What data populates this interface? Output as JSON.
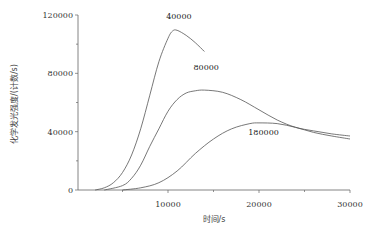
{
  "chart_data": {
    "type": "line",
    "title": "",
    "xlabel": "时间/s",
    "ylabel": "化学发光强度/(计数/s)",
    "xlim": [
      0,
      30000
    ],
    "ylim": [
      0,
      120000
    ],
    "x_ticks": [
      10000,
      20000,
      30000
    ],
    "x_tick_labels": [
      "10000",
      "20000",
      "30000"
    ],
    "y_ticks": [
      0,
      40000,
      80000,
      120000
    ],
    "y_tick_labels": [
      "0",
      "40000",
      "80000",
      "120000"
    ],
    "grid": false,
    "legend": "inline labels near curves",
    "series": [
      {
        "name": "40000",
        "label_pos": [
          11200,
          117000
        ],
        "x": [
          2000,
          3000,
          4000,
          5000,
          6000,
          7000,
          8000,
          9000,
          10000,
          10500,
          11000,
          12000,
          13000,
          14000
        ],
        "values": [
          0,
          1500,
          5000,
          12000,
          24000,
          42000,
          65000,
          88000,
          104000,
          109000,
          109500,
          106000,
          101000,
          95000
        ]
      },
      {
        "name": "80000",
        "label_pos": [
          14200,
          82000
        ],
        "x": [
          3000,
          5000,
          6000,
          7000,
          8000,
          9000,
          10000,
          11000,
          12000,
          13000,
          14000,
          16000,
          18000,
          20000,
          22000,
          24000,
          26000,
          28000,
          30000
        ],
        "values": [
          0,
          3000,
          8000,
          17000,
          30000,
          42000,
          54000,
          62000,
          66500,
          68000,
          68500,
          67000,
          62000,
          55000,
          48000,
          43000,
          40500,
          38500,
          37000
        ]
      },
      {
        "name": "180000",
        "label_pos": [
          20500,
          38000
        ],
        "x": [
          5000,
          7000,
          9000,
          11000,
          13000,
          15000,
          17000,
          19000,
          20000,
          22000,
          24000,
          26000,
          28000,
          30000
        ],
        "values": [
          0,
          1500,
          5000,
          13000,
          25000,
          35000,
          42000,
          45500,
          46000,
          45500,
          43000,
          39500,
          37000,
          35000
        ]
      }
    ]
  },
  "colors": {
    "line": "#555555",
    "axis": "#666666",
    "text": "#333333"
  }
}
